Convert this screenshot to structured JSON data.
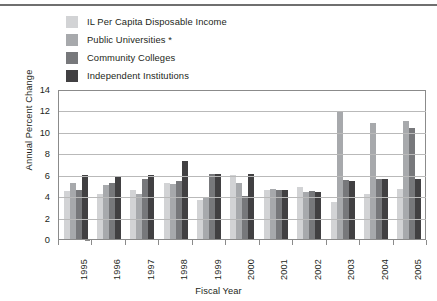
{
  "chart_data": {
    "type": "bar",
    "title": "",
    "xlabel": "Fiscal Year",
    "ylabel": "Annual Percent Change",
    "ylim": [
      0,
      14
    ],
    "yticks": [
      0,
      2,
      4,
      6,
      8,
      10,
      12,
      14
    ],
    "grid": true,
    "legend_position": "top-left",
    "categories": [
      "1995",
      "1996",
      "1997",
      "1998",
      "1999",
      "2000",
      "2001",
      "2002",
      "2003",
      "2004",
      "2005"
    ],
    "series": [
      {
        "name": "IL Per Capita Disposable Income",
        "color": "#d2d3d5",
        "values": [
          4.5,
          4.2,
          4.6,
          5.2,
          3.6,
          6.0,
          4.6,
          4.9,
          3.5,
          4.2,
          4.7
        ]
      },
      {
        "name": "Public Universities *",
        "color": "#a7a9ac",
        "values": [
          5.2,
          5.0,
          4.2,
          5.1,
          3.9,
          5.2,
          4.7,
          4.4,
          11.9,
          10.8,
          11.0
        ]
      },
      {
        "name": "Community Colleges",
        "color": "#77787b",
        "values": [
          4.6,
          5.2,
          5.6,
          5.4,
          6.1,
          4.0,
          4.6,
          4.5,
          5.5,
          5.6,
          10.4
        ]
      },
      {
        "name": "Independent Institutions",
        "color": "#414042",
        "values": [
          6.0,
          5.9,
          6.0,
          7.3,
          6.1,
          6.1,
          4.6,
          4.4,
          5.4,
          5.6,
          5.6
        ]
      }
    ]
  },
  "legend": {
    "items": [
      {
        "label": "IL Per Capita Disposable Income",
        "color": "#d2d3d5"
      },
      {
        "label": "Public Universities *",
        "color": "#a7a9ac"
      },
      {
        "label": "Community Colleges",
        "color": "#77787b"
      },
      {
        "label": "Independent Institutions",
        "color": "#414042"
      }
    ]
  },
  "axes": {
    "y_title": "Annual Percent Change",
    "x_title": "Fiscal Year",
    "y_ticks": [
      "14",
      "12",
      "10",
      "8",
      "6",
      "4",
      "2",
      "0"
    ],
    "x_ticks": [
      "1995",
      "1996",
      "1997",
      "1998",
      "1999",
      "2000",
      "2001",
      "2002",
      "2003",
      "2004",
      "2005"
    ]
  }
}
